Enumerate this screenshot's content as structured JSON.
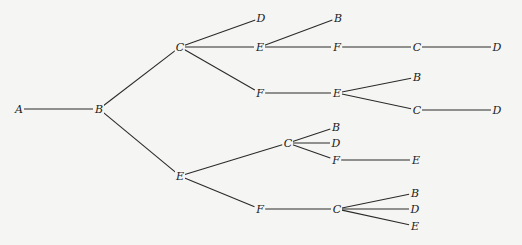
{
  "diagram": {
    "type": "tree",
    "orientation": "left-to-right",
    "line_color": "#2a2a2a",
    "background": "#f5f5f3",
    "nodes": [
      {
        "id": "n1",
        "label": "A",
        "x": 19,
        "y": 109
      },
      {
        "id": "n2",
        "label": "B",
        "x": 99,
        "y": 109
      },
      {
        "id": "n3",
        "label": "C",
        "x": 180,
        "y": 47
      },
      {
        "id": "n4",
        "label": "E",
        "x": 180,
        "y": 176
      },
      {
        "id": "n5",
        "label": "D",
        "x": 261,
        "y": 18
      },
      {
        "id": "n6",
        "label": "E",
        "x": 260,
        "y": 47
      },
      {
        "id": "n7",
        "label": "F",
        "x": 260,
        "y": 93
      },
      {
        "id": "n8",
        "label": "B",
        "x": 338,
        "y": 18
      },
      {
        "id": "n9",
        "label": "F",
        "x": 337,
        "y": 47
      },
      {
        "id": "n10",
        "label": "C",
        "x": 417,
        "y": 47
      },
      {
        "id": "n11",
        "label": "D",
        "x": 497,
        "y": 47
      },
      {
        "id": "n12",
        "label": "E",
        "x": 337,
        "y": 93
      },
      {
        "id": "n13",
        "label": "B",
        "x": 417,
        "y": 77
      },
      {
        "id": "n14",
        "label": "C",
        "x": 417,
        "y": 110
      },
      {
        "id": "n15",
        "label": "D",
        "x": 497,
        "y": 110
      },
      {
        "id": "n16",
        "label": "C",
        "x": 288,
        "y": 143
      },
      {
        "id": "n17",
        "label": "F",
        "x": 260,
        "y": 209
      },
      {
        "id": "n18",
        "label": "B",
        "x": 336,
        "y": 127
      },
      {
        "id": "n19",
        "label": "D",
        "x": 336,
        "y": 143
      },
      {
        "id": "n20",
        "label": "F",
        "x": 336,
        "y": 160
      },
      {
        "id": "n21",
        "label": "E",
        "x": 416,
        "y": 160
      },
      {
        "id": "n22",
        "label": "C",
        "x": 337,
        "y": 209
      },
      {
        "id": "n23",
        "label": "B",
        "x": 415,
        "y": 193
      },
      {
        "id": "n24",
        "label": "D",
        "x": 415,
        "y": 209
      },
      {
        "id": "n25",
        "label": "E",
        "x": 415,
        "y": 226
      }
    ],
    "edges": [
      [
        "n1",
        "n2"
      ],
      [
        "n2",
        "n3"
      ],
      [
        "n2",
        "n4"
      ],
      [
        "n3",
        "n5"
      ],
      [
        "n3",
        "n6"
      ],
      [
        "n3",
        "n7"
      ],
      [
        "n6",
        "n8"
      ],
      [
        "n6",
        "n9"
      ],
      [
        "n9",
        "n10"
      ],
      [
        "n10",
        "n11"
      ],
      [
        "n7",
        "n12"
      ],
      [
        "n12",
        "n13"
      ],
      [
        "n12",
        "n14"
      ],
      [
        "n14",
        "n15"
      ],
      [
        "n4",
        "n16"
      ],
      [
        "n4",
        "n17"
      ],
      [
        "n16",
        "n18"
      ],
      [
        "n16",
        "n19"
      ],
      [
        "n16",
        "n20"
      ],
      [
        "n20",
        "n21"
      ],
      [
        "n17",
        "n22"
      ],
      [
        "n22",
        "n23"
      ],
      [
        "n22",
        "n24"
      ],
      [
        "n22",
        "n25"
      ]
    ]
  }
}
